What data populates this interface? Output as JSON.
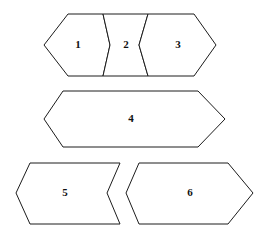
{
  "figure": {
    "kind": "polygon-pieces-diagram",
    "width": 267,
    "height": 237,
    "background_color": "#ffffff",
    "stroke_color": "#1c1c1c",
    "fill_color": "#ffffff",
    "label_color": "#111111",
    "stroke_width": 1,
    "rows": [
      {
        "name": "top-row",
        "piece_labels": [
          "1",
          "2",
          "3"
        ]
      },
      {
        "name": "middle-row",
        "piece_labels": [
          "4"
        ]
      },
      {
        "name": "bottom-row",
        "piece_labels": [
          "5",
          "6"
        ]
      }
    ]
  },
  "pieces": [
    {
      "id": "piece-1",
      "label": "1",
      "row": "top-row",
      "shape": "hexagon",
      "points": "68,14 103,14 110,45 103,76 68,76 44,45",
      "label_x": 78,
      "label_y": 45
    },
    {
      "id": "piece-2",
      "label": "2",
      "row": "top-row",
      "shape": "concave-hourglass",
      "points": "103,14 148,14 139,45 148,76 103,76 110,45",
      "label_x": 126,
      "label_y": 45
    },
    {
      "id": "piece-3",
      "label": "3",
      "row": "top-row",
      "shape": "hexagon",
      "points": "148,14 194,14 216,45 194,76 148,76 139,45",
      "label_x": 178,
      "label_y": 45
    },
    {
      "id": "piece-4",
      "label": "4",
      "row": "middle-row",
      "shape": "elongated-hexagon",
      "points": "63,91 198,91 225,119 198,147 63,147 44,119",
      "label_x": 131,
      "label_y": 119
    },
    {
      "id": "piece-5",
      "label": "5",
      "row": "bottom-row",
      "shape": "chevron-point-left-notch-right",
      "points": "30,163 120,163 107,193 120,224 30,224 16,193",
      "label_x": 65,
      "label_y": 193
    },
    {
      "id": "piece-6",
      "label": "6",
      "row": "bottom-row",
      "shape": "chevron-notch-left-point-right",
      "points": "139,163 228,163 253,193 228,224 139,163 139,224 126,193",
      "points_fixed": "139,163 228,163 253,193 228,224 139,224 126,193",
      "label_x": 190,
      "label_y": 193
    }
  ]
}
